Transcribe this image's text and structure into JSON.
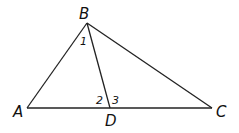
{
  "diagram": {
    "type": "triangle",
    "vertices": [
      {
        "id": "A",
        "label": "A",
        "x": 27,
        "y": 108
      },
      {
        "id": "B",
        "label": "B",
        "x": 87,
        "y": 23
      },
      {
        "id": "C",
        "label": "C",
        "x": 212,
        "y": 108
      },
      {
        "id": "D",
        "label": "D",
        "x": 110,
        "y": 108
      }
    ],
    "segments": [
      {
        "from": "A",
        "to": "B"
      },
      {
        "from": "B",
        "to": "C"
      },
      {
        "from": "A",
        "to": "C"
      },
      {
        "from": "B",
        "to": "D"
      }
    ],
    "angle_labels": [
      {
        "id": "angle-1",
        "label": "1",
        "at": "B"
      },
      {
        "id": "angle-2",
        "label": "2",
        "at": "D"
      },
      {
        "id": "angle-3",
        "label": "3",
        "at": "D"
      }
    ],
    "colors": {
      "stroke": "#222222",
      "text": "#111111",
      "background": "#ffffff"
    }
  }
}
